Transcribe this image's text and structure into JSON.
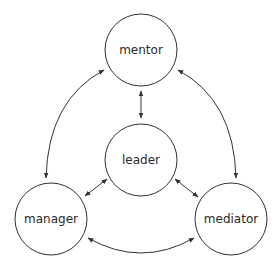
{
  "diagram": {
    "type": "relationship-cycle",
    "nodes": [
      {
        "id": "mentor",
        "label": "mentor",
        "cx": 141,
        "cy": 50,
        "r": 36
      },
      {
        "id": "leader",
        "label": "leader",
        "cx": 141,
        "cy": 160,
        "r": 36
      },
      {
        "id": "manager",
        "label": "manager",
        "cx": 51,
        "cy": 219,
        "r": 36
      },
      {
        "id": "mediator",
        "label": "mediator",
        "cx": 231,
        "cy": 219,
        "r": 36
      }
    ],
    "edges": [
      {
        "from": "mentor",
        "to": "leader",
        "direction": "bidirectional"
      },
      {
        "from": "leader",
        "to": "manager",
        "direction": "bidirectional"
      },
      {
        "from": "leader",
        "to": "mediator",
        "direction": "bidirectional"
      },
      {
        "from": "mentor",
        "to": "manager",
        "direction": "bidirectional",
        "curved": true
      },
      {
        "from": "mentor",
        "to": "mediator",
        "direction": "bidirectional",
        "curved": true
      },
      {
        "from": "manager",
        "to": "mediator",
        "direction": "bidirectional",
        "curved": true
      }
    ],
    "colors": {
      "stroke": "#333333",
      "background": "#ffffff",
      "text": "#2a2a2a"
    }
  }
}
